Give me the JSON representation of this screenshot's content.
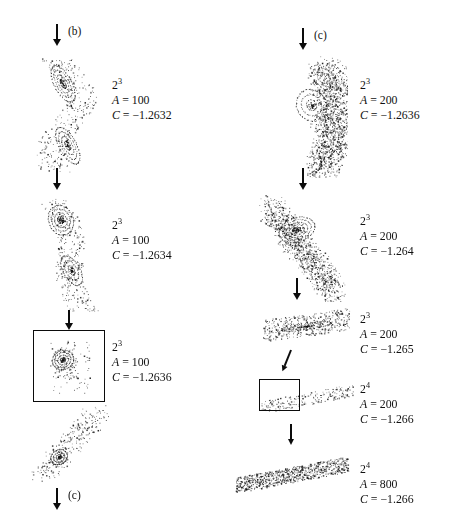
{
  "figure": {
    "background": "#ffffff",
    "ink": "#111111"
  },
  "tags": [
    {
      "id": "tag-b-top-left",
      "label": "(b)"
    },
    {
      "id": "tag-c-top-right",
      "label": "(c)"
    },
    {
      "id": "tag-c-bottom-left",
      "label": "(c)"
    }
  ],
  "left_column": {
    "captions": [
      {
        "power_base": "2",
        "power_exp": "3",
        "a_label": "A",
        "a_value": "100",
        "c_label": "C",
        "c_value": "−1.2632"
      },
      {
        "power_base": "2",
        "power_exp": "3",
        "a_label": "A",
        "a_value": "100",
        "c_label": "C",
        "c_value": "−1.2634"
      },
      {
        "power_base": "2",
        "power_exp": "3",
        "a_label": "A",
        "a_value": "100",
        "c_label": "C",
        "c_value": "−1.2636"
      }
    ]
  },
  "right_column": {
    "captions": [
      {
        "power_base": "2",
        "power_exp": "3",
        "a_label": "A",
        "a_value": "200",
        "c_label": "C",
        "c_value": "−1.2636"
      },
      {
        "power_base": "2",
        "power_exp": "3",
        "a_label": "A",
        "a_value": "200",
        "c_label": "C",
        "c_value": "−1.264"
      },
      {
        "power_base": "2",
        "power_exp": "3",
        "a_label": "A",
        "a_value": "200",
        "c_label": "C",
        "c_value": "−1.265"
      },
      {
        "power_base": "2",
        "power_exp": "4",
        "a_label": "A",
        "a_value": "200",
        "c_label": "C",
        "c_value": "−1.266"
      },
      {
        "power_base": "2",
        "power_exp": "4",
        "a_label": "A",
        "a_value": "800",
        "c_label": "C",
        "c_value": "−1.266"
      }
    ]
  },
  "equals_sign": "=",
  "chart_data": {
    "type": "scatter",
    "xlabel": "",
    "ylabel": "",
    "grid": false,
    "legend": null,
    "panels": [
      {
        "id": "left-1",
        "column": "left",
        "label_power": "2^3",
        "A": 100,
        "C": -1.2632,
        "structure": "two-island chain with surrounding sparse halo, S-shaped spine",
        "point_count": 560,
        "bbox_px": [
          26,
          52,
          78,
          126
        ],
        "islands": [
          {
            "cx": 0.47,
            "cy": 0.25,
            "rx": 0.11,
            "ry": 0.16,
            "rot_deg": -28,
            "rings": 4
          },
          {
            "cx": 0.53,
            "cy": 0.74,
            "rx": 0.11,
            "ry": 0.16,
            "rot_deg": -28,
            "rings": 4
          }
        ],
        "halo_density": 0.55
      },
      {
        "id": "left-2",
        "column": "left",
        "label_power": "2^3",
        "A": 100,
        "C": -1.2634,
        "structure": "single elongated island chain tilting down-right with sparse halo",
        "point_count": 600,
        "bbox_px": [
          26,
          192,
          82,
          126
        ],
        "islands": [
          {
            "cx": 0.42,
            "cy": 0.22,
            "rx": 0.15,
            "ry": 0.12,
            "rot_deg": -20,
            "rings": 4
          },
          {
            "cx": 0.55,
            "cy": 0.62,
            "rx": 0.1,
            "ry": 0.13,
            "rot_deg": -30,
            "rings": 3
          }
        ],
        "halo_density": 0.5
      },
      {
        "id": "left-3-boxed",
        "column": "left",
        "label_power": "2^3",
        "A": 100,
        "C": -1.2636,
        "structure": "magnified island inside a framing rectangle",
        "point_count": 420,
        "bbox_px": [
          33,
          330,
          70,
          70
        ],
        "has_box": true,
        "islands": [
          {
            "cx": 0.42,
            "cy": 0.42,
            "rx": 0.16,
            "ry": 0.14,
            "rot_deg": -25,
            "rings": 4
          }
        ],
        "halo_density": 0.35
      },
      {
        "id": "left-4",
        "column": "left",
        "label_power": null,
        "A": null,
        "C": null,
        "structure": "diagonal chain of small islands, magnified view",
        "point_count": 520,
        "bbox_px": [
          26,
          404,
          86,
          80
        ],
        "islands": [
          {
            "cx": 0.38,
            "cy": 0.66,
            "rx": 0.1,
            "ry": 0.09,
            "rot_deg": -30,
            "rings": 3
          }
        ],
        "halo_density": 0.5
      },
      {
        "id": "right-1",
        "column": "right",
        "label_power": "2^3",
        "A": 200,
        "C": -1.2636,
        "structure": "dense chaotic crescent sweeping down-right, partially resolved spiral arms",
        "point_count": 1400,
        "bbox_px": [
          256,
          52,
          92,
          126
        ],
        "islands": [
          {
            "cx": 0.6,
            "cy": 0.42,
            "rx": 0.16,
            "ry": 0.13,
            "rot_deg": -35,
            "rings": 3
          }
        ],
        "halo_density": 1.0
      },
      {
        "id": "right-2",
        "column": "right",
        "label_power": "2^3",
        "A": 200,
        "C": -1.264,
        "structure": "single large island with concentric rings embedded in chaotic sea",
        "point_count": 1150,
        "bbox_px": [
          256,
          192,
          92,
          110
        ],
        "islands": [
          {
            "cx": 0.44,
            "cy": 0.34,
            "rx": 0.2,
            "ry": 0.11,
            "rot_deg": -18,
            "rings": 5
          }
        ],
        "halo_density": 0.9
      },
      {
        "id": "right-3",
        "column": "right",
        "label_power": "2^3",
        "A": 200,
        "C": -1.265,
        "structure": "flattened elongated chaotic band with faint inner loops",
        "point_count": 620,
        "bbox_px": [
          258,
          306,
          96,
          40
        ],
        "islands": [
          {
            "cx": 0.5,
            "cy": 0.5,
            "rx": 0.26,
            "ry": 0.08,
            "rot_deg": -8,
            "rings": 3
          }
        ],
        "halo_density": 0.7
      },
      {
        "id": "right-4-boxed",
        "column": "right",
        "label_power": "2^4",
        "A": 200,
        "C": -1.266,
        "structure": "thin diagonal filament with small framing rectangle at its left end",
        "point_count": 420,
        "bbox_px": [
          258,
          378,
          98,
          42
        ],
        "has_box": true,
        "islands": [],
        "halo_density": 0.5
      },
      {
        "id": "right-5",
        "column": "right",
        "label_power": "2^4",
        "A": 800,
        "C": -1.266,
        "structure": "thin dense diagonal chaotic band, fully magnified",
        "point_count": 900,
        "bbox_px": [
          232,
          452,
          120,
          46
        ],
        "islands": [],
        "halo_density": 1.0
      }
    ]
  }
}
